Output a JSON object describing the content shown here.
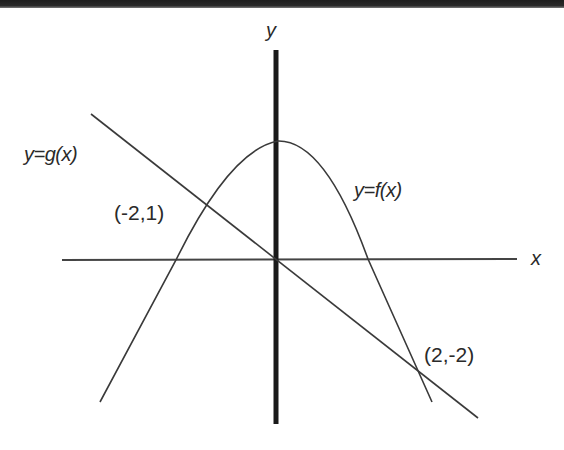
{
  "diagram": {
    "axes": {
      "x_label": "x",
      "y_label": "y"
    },
    "curves": [
      {
        "id": "f",
        "label": "y=f(x)",
        "type": "downward parabola"
      },
      {
        "id": "g",
        "label": "y=g(x)",
        "type": "line with negative slope through origin"
      }
    ],
    "points": [
      {
        "label": "(-2,1)",
        "x": -2,
        "y": 1,
        "desc": "intersection of f and g"
      },
      {
        "label": "(2,-2)",
        "x": 2,
        "y": -2,
        "desc": "intersection of f and g"
      }
    ],
    "colors": {
      "stroke": "#3a3a3a",
      "axis_y": "#1a1a1a",
      "text": "#2a2a2a",
      "background": "#ffffff"
    }
  }
}
